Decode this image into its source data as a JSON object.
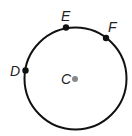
{
  "diagram": {
    "type": "circle",
    "center": {
      "label": "C",
      "x": 75,
      "y": 79,
      "color": "#888888"
    },
    "radius": 51,
    "points": [
      {
        "label": "D",
        "x": 25,
        "y": 70
      },
      {
        "label": "E",
        "x": 66,
        "y": 27
      },
      {
        "label": "F",
        "x": 106,
        "y": 38
      }
    ],
    "stroke_color": "#111111"
  }
}
